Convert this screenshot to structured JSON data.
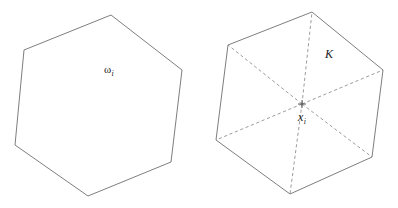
{
  "figure": {
    "background_color": "#ffffff",
    "width": 398,
    "height": 208,
    "stroke_color": "#6f6f6f",
    "dashed_stroke_color": "#8a8a8a"
  },
  "left_shape": {
    "name": "hexagon-omega",
    "label_base": "ω",
    "label_subscript": "i",
    "edge_style": "solid",
    "vertices": [
      [
        111,
        15
      ],
      [
        182,
        70
      ],
      [
        171,
        162
      ],
      [
        88,
        196
      ],
      [
        15,
        145
      ],
      [
        24,
        50
      ]
    ]
  },
  "right_shape": {
    "name": "hexagon-K",
    "label_base": "K",
    "center_label_base": "x",
    "center_label_subscript": "i",
    "edge_style": "solid",
    "diagonal_style": "dashed",
    "center_point": [
      302,
      104
    ],
    "vertices": [
      [
        312,
        12
      ],
      [
        383,
        70
      ],
      [
        372,
        157
      ],
      [
        290,
        194
      ],
      [
        216,
        140
      ],
      [
        228,
        45
      ]
    ]
  }
}
